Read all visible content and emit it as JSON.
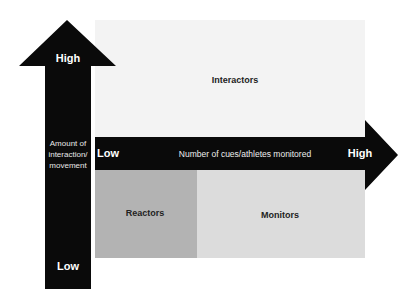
{
  "diagram": {
    "regions": [
      {
        "name": "Interactors",
        "color": "#f3f3f3"
      },
      {
        "name": "Reactors",
        "color": "#b3b3b3"
      },
      {
        "name": "Monitors",
        "color": "#dcdcdc"
      }
    ],
    "vertical_axis": {
      "title": "Amount of interaction/ movement",
      "title_line1": "Amount of",
      "title_line2": "interaction/",
      "title_line3": "movement",
      "high_label": "High",
      "low_label": "Low",
      "color": "#0a0a0a"
    },
    "horizontal_axis": {
      "title": "Number of cues/athletes monitored",
      "high_label": "High",
      "low_label": "Low",
      "color": "#0a0a0a"
    }
  }
}
